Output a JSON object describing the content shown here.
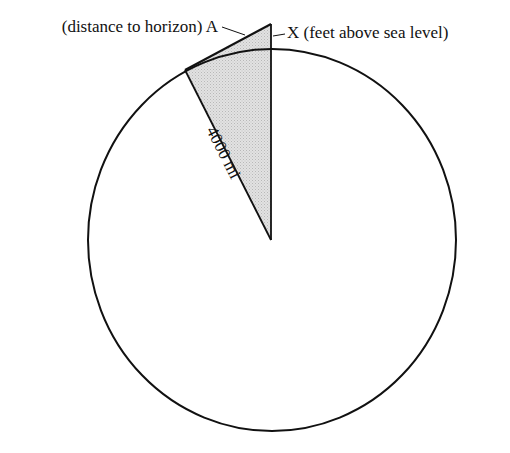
{
  "diagram": {
    "labels": {
      "distance": "(distance to horizon) A",
      "height": "X (feet above sea level)",
      "radius": "4000 mi"
    },
    "colors": {
      "stroke": "#111111",
      "fill_shaded": "#d9d9d9",
      "background": "#ffffff"
    },
    "geometry": {
      "circle_center": [
        272,
        240
      ],
      "circle_rx": 184,
      "circle_ry": 191,
      "apex": [
        271,
        24
      ],
      "tangent_point": [
        185,
        70
      ]
    }
  }
}
